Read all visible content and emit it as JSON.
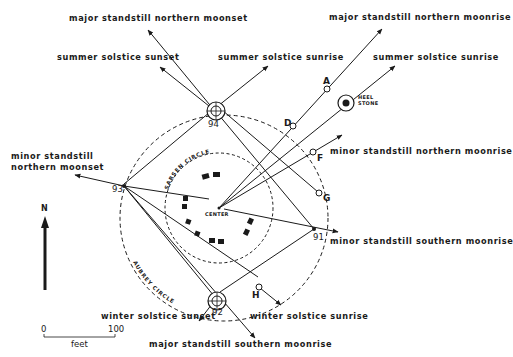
{
  "labels": {
    "major_standstill_northern_moonset": "major standstill northern moonset",
    "major_standstill_northern_moonrise": "major standstill northern moonrise",
    "summer_solstice_sunset": "summer solstice sunset",
    "summer_solstice_sunrise_upper": "summer solstice sunrise",
    "summer_solstice_sunrise_right": "summer solstice sunrise",
    "minor_standstill_northern_moonset_line1": "minor standstill",
    "minor_standstill_northern_moonset_line2": "northern moonset",
    "minor_standstill_northern_moonrise": "minor standstill northern moonrise",
    "minor_standstill_southern_moonrise": "minor standstill southern moonrise",
    "winter_solstice_sunset": "winter solstice sunset",
    "winter_solstice_sunrise": "winter solstice sunrise",
    "major_standstill_southern_moonrise": "major standstill southern moonrise"
  },
  "features": {
    "heel_stone_line1": "HEEL",
    "heel_stone_line2": "STONE",
    "center": "CENTER",
    "sarsen_circle": "SARSEN CIRCLE",
    "aubrey_circle": "AUBREY CIRCLE"
  },
  "markers": {
    "A": "A",
    "D": "D",
    "F": "F",
    "G": "G",
    "H": "H"
  },
  "stations": {
    "s91": "91",
    "s92": "92",
    "s93": "93",
    "s94": "94"
  },
  "north_arrow": {
    "label": "N"
  },
  "scale_bar": {
    "start": "0",
    "end": "100",
    "unit": "feet"
  },
  "colors": {
    "ink": "#1a1a1a",
    "background": "#ffffff"
  }
}
